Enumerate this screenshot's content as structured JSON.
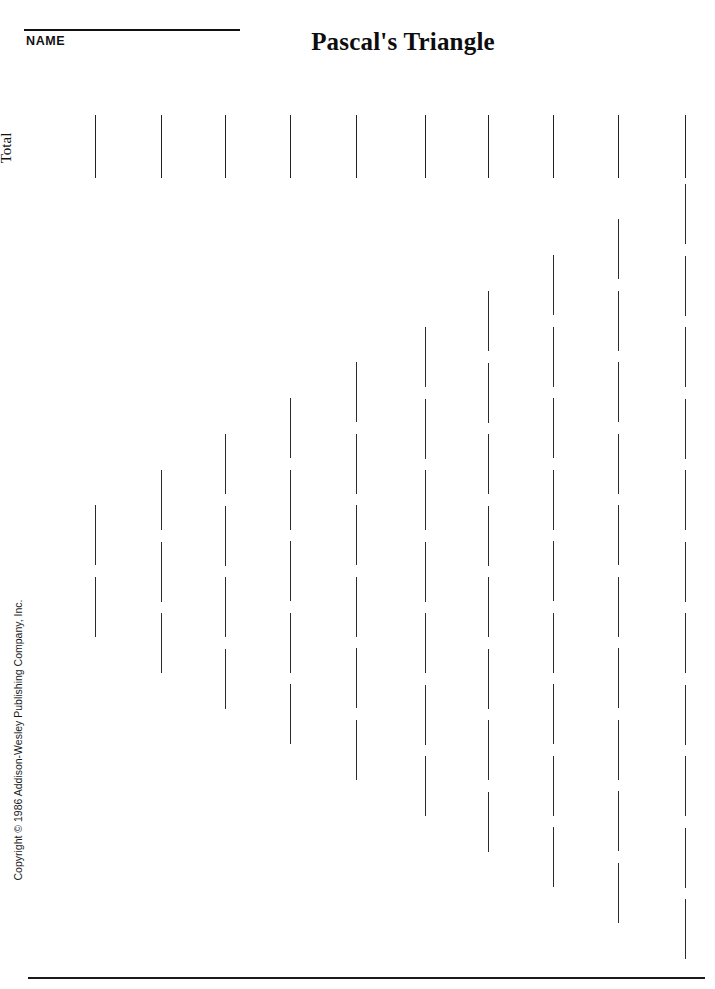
{
  "page": {
    "width": 715,
    "height": 989,
    "background": "#ffffff",
    "ink_color": "#2b2b2b"
  },
  "header": {
    "name_label": "NAME",
    "title": "Pascal's Triangle"
  },
  "labels": {
    "total": "Total",
    "copyright": "Copyright © 1986 Addison-Wesley Publishing Company, Inc."
  },
  "grid": {
    "column_count": 10,
    "column_x": [
      95,
      161,
      225,
      290,
      356,
      425,
      488,
      553,
      618,
      685
    ],
    "total_row": {
      "top": 115,
      "height": 63
    },
    "segment_height": 60,
    "segment_pitch": 71.5,
    "column_tops": [
      505,
      470,
      434,
      398,
      362,
      327,
      291,
      255,
      219,
      184
    ],
    "column_segment_counts": [
      2,
      3,
      4,
      5,
      6,
      7,
      8,
      9,
      10,
      11
    ]
  },
  "footer": {
    "rule_left": 28,
    "rule_top": 977,
    "rule_width": 677
  }
}
